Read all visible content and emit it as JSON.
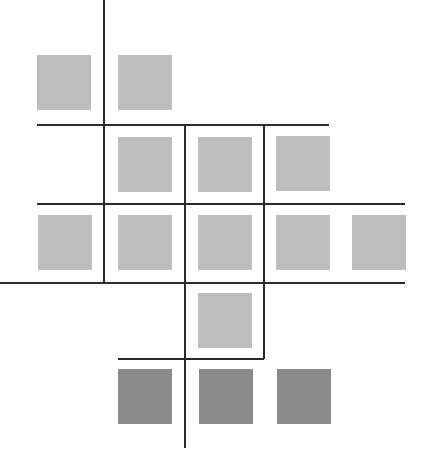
{
  "colors": {
    "background": "#ffffff",
    "light_square": "#bdbdbd",
    "dark_square": "#8a8a8a",
    "line": "#2a2a2a"
  },
  "squares": [
    {
      "x": 37,
      "y": 55,
      "tone": "light"
    },
    {
      "x": 118,
      "y": 55,
      "tone": "light"
    },
    {
      "x": 118,
      "y": 137,
      "tone": "light"
    },
    {
      "x": 198,
      "y": 137,
      "tone": "light"
    },
    {
      "x": 276,
      "y": 136,
      "tone": "light"
    },
    {
      "x": 38,
      "y": 215,
      "tone": "light"
    },
    {
      "x": 118,
      "y": 215,
      "tone": "light"
    },
    {
      "x": 198,
      "y": 215,
      "tone": "light"
    },
    {
      "x": 276,
      "y": 215,
      "tone": "light"
    },
    {
      "x": 352,
      "y": 215,
      "tone": "light"
    },
    {
      "x": 198,
      "y": 293,
      "tone": "light"
    },
    {
      "x": 118,
      "y": 369,
      "tone": "dark"
    },
    {
      "x": 199,
      "y": 369,
      "tone": "dark"
    },
    {
      "x": 277,
      "y": 369,
      "tone": "dark"
    }
  ],
  "lines": [
    {
      "orient": "v",
      "x": 103,
      "y1": 0,
      "y2": 283
    },
    {
      "orient": "v",
      "x": 184,
      "y1": 125,
      "y2": 448
    },
    {
      "orient": "v",
      "x": 263,
      "y1": 125,
      "y2": 359
    },
    {
      "orient": "h",
      "y": 124,
      "x1": 37,
      "x2": 329
    },
    {
      "orient": "h",
      "y": 203,
      "x1": 37,
      "x2": 405
    },
    {
      "orient": "h",
      "y": 282,
      "x1": 0,
      "x2": 405
    },
    {
      "orient": "h",
      "y": 358,
      "x1": 118,
      "x2": 264
    }
  ]
}
